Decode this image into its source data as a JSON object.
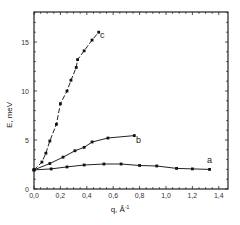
{
  "chart_data": {
    "type": "line",
    "title": "",
    "xlabel": "q, Å⁻¹",
    "ylabel": "E, meV",
    "xlim": [
      0.0,
      1.4
    ],
    "ylim": [
      0,
      18
    ],
    "grid": false,
    "legend": "none (curves labeled inline a, b, c)",
    "x_ticks": [
      "0,0",
      "0,2",
      "0,4",
      "0,6",
      "0,8",
      "1,0",
      "1,2",
      "1,4"
    ],
    "y_ticks": [
      "0",
      "5",
      "10",
      "15"
    ],
    "series": [
      {
        "name": "a",
        "style": "solid",
        "x": [
          0.0,
          0.13,
          0.25,
          0.38,
          0.53,
          0.66,
          0.8,
          0.93,
          1.08,
          1.2,
          1.33
        ],
        "y": [
          1.95,
          2.05,
          2.25,
          2.45,
          2.55,
          2.55,
          2.4,
          2.35,
          2.1,
          2.05,
          2.0
        ]
      },
      {
        "name": "b",
        "style": "solid",
        "x": [
          0.0,
          0.12,
          0.22,
          0.31,
          0.38,
          0.44,
          0.56,
          0.76
        ],
        "y": [
          1.95,
          2.6,
          3.25,
          3.9,
          4.25,
          4.8,
          5.2,
          5.45
        ]
      },
      {
        "name": "c",
        "style": "dashed",
        "x": [
          0.0,
          0.06,
          0.09,
          0.12,
          0.17,
          0.2,
          0.25,
          0.28,
          0.32,
          0.33,
          0.38,
          0.44,
          0.49
        ],
        "y": [
          1.95,
          2.75,
          3.65,
          4.9,
          6.6,
          8.7,
          10.0,
          11.1,
          12.4,
          13.2,
          14.1,
          15.2,
          16.0
        ]
      }
    ]
  },
  "labels": {
    "xlabel": "q, Å",
    "xlabel_sup": "-1",
    "ylabel": "E, meV",
    "curve_a": "a",
    "curve_b": "b",
    "curve_c": "c"
  }
}
